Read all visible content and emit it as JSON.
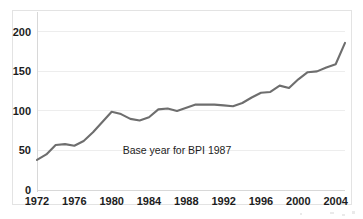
{
  "figure": {
    "annotation": "Base year for BPI 1987",
    "line_color": "#6e6e6e",
    "grid_color": "#ededed",
    "background_color": "#ffffff"
  },
  "chart_data": {
    "type": "line",
    "title": "",
    "xlabel": "",
    "ylabel": "",
    "xlim": [
      1972,
      2005
    ],
    "ylim": [
      0,
      215
    ],
    "grid": true,
    "legend": "none",
    "annotations": [
      {
        "text": "Base year for BPI 1987",
        "x": 1987,
        "y": 45
      }
    ],
    "y_ticks": [
      0,
      50,
      100,
      150,
      200
    ],
    "y_tick_labels": [
      "0",
      "50",
      "100",
      "150",
      "200"
    ],
    "x_ticks": [
      1972,
      1976,
      1980,
      1984,
      1988,
      1992,
      1996,
      2000,
      2004
    ],
    "x_tick_labels": [
      "1972",
      "1976",
      "1980",
      "1984",
      "1988",
      "1992",
      "1996",
      "2000",
      "2004"
    ],
    "series": [
      {
        "name": "BPI",
        "x": [
          1972,
          1973,
          1974,
          1975,
          1976,
          1977,
          1978,
          1979,
          1980,
          1981,
          1982,
          1983,
          1984,
          1985,
          1986,
          1987,
          1988,
          1989,
          1990,
          1991,
          1992,
          1993,
          1994,
          1995,
          1996,
          1997,
          1998,
          1999,
          2000,
          2001,
          2002,
          2003,
          2004,
          2005
        ],
        "values": [
          38,
          45,
          57,
          58,
          56,
          62,
          73,
          86,
          99,
          96,
          90,
          88,
          92,
          102,
          103,
          100,
          104,
          108,
          108,
          108,
          107,
          106,
          110,
          117,
          123,
          124,
          132,
          129,
          140,
          149,
          150,
          155,
          159,
          186
        ]
      }
    ]
  }
}
